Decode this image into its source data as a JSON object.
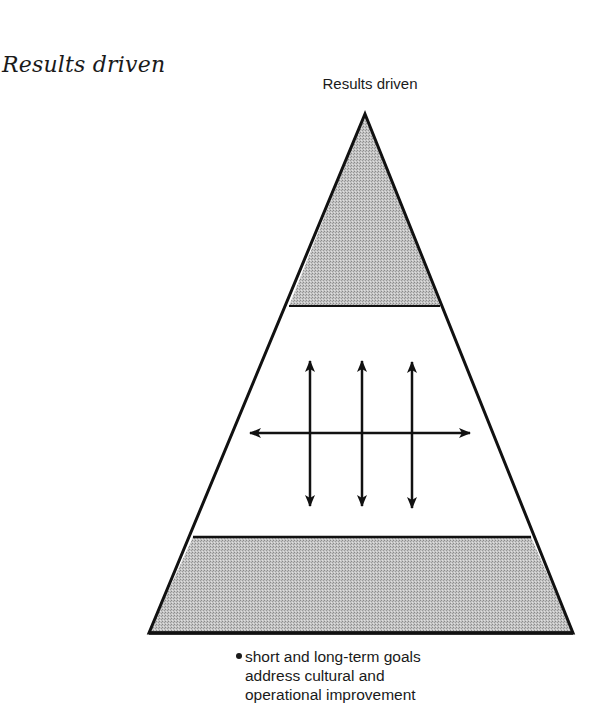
{
  "page": {
    "heading": "Results driven"
  },
  "diagram": {
    "title": "Results driven",
    "shape": "pyramid",
    "bands": [
      {
        "name": "top",
        "fill": "shaded"
      },
      {
        "name": "middle",
        "fill": "white",
        "content": "bidirectional arrows: one horizontal crossing three vertical"
      },
      {
        "name": "bottom",
        "fill": "shaded"
      }
    ],
    "colors": {
      "stroke": "#111111",
      "shade": "#b8b8b8",
      "background": "#ffffff"
    },
    "caption": {
      "bullet_lines": [
        "short and long-term goals",
        "address cultural and",
        "operational improvement"
      ]
    }
  }
}
